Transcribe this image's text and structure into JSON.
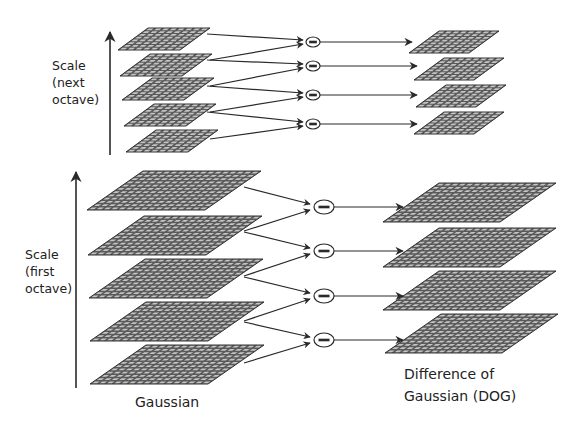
{
  "colors": {
    "background": "#ffffff",
    "ink": "#222222",
    "plane_fill": "#5a5a5a",
    "grid_line": "#d8d8d8",
    "arrow": "#2a2a2a"
  },
  "next_octave": {
    "axis_label_lines": [
      "Scale",
      "(next",
      "octave)"
    ],
    "gaussian_planes": 5,
    "dog_planes": 4,
    "grid_size": [
      8,
      8
    ],
    "subtract_symbol": "−"
  },
  "first_octave": {
    "axis_label_lines": [
      "Scale",
      "(first",
      "octave)"
    ],
    "gaussian_planes": 5,
    "dog_planes": 4,
    "grid_size": [
      16,
      12
    ],
    "subtract_symbol": "−"
  },
  "captions": {
    "gaussian": "Gaussian",
    "dog_line1": "Difference of",
    "dog_line2": "Gaussian (DOG)"
  }
}
